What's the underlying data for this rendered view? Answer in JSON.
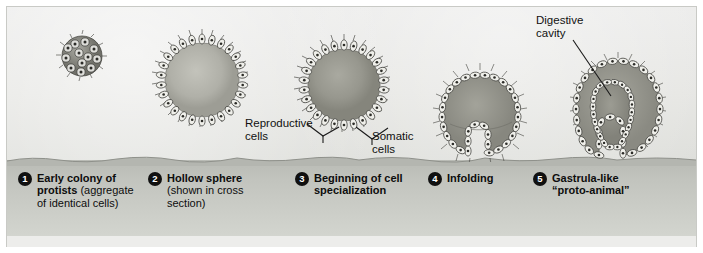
{
  "figure": {
    "colors": {
      "sky": "#e7e7e4",
      "ground": "#c2c4be",
      "ink": "#111111",
      "badge": "#101010",
      "badge_text": "#ffffff",
      "cell_fill": "#efefea",
      "cell_outline": "#4a4a46",
      "interior": "#9a9a93"
    }
  },
  "callouts": [
    {
      "id": "reproductive",
      "label": "Reproductive\ncells"
    },
    {
      "id": "somatic",
      "label": "Somatic\ncells"
    },
    {
      "id": "digestive",
      "label": "Digestive\ncavity"
    }
  ],
  "stages": [
    {
      "number": "1",
      "title": "Early colony of protists",
      "title_bold": "Early colony of\nprotists",
      "line1": "Early colony of",
      "rest_bold": "protists",
      "rest_regular": " (aggregate\nof identical cells)",
      "detail": "(aggregate of identical cells)"
    },
    {
      "number": "2",
      "title": "Hollow sphere",
      "line1": "Hollow sphere",
      "rest_bold": "",
      "rest_regular": "(shown in cross\nsection)",
      "detail": "(shown in cross section)"
    },
    {
      "number": "3",
      "title": "Beginning of cell specialization",
      "line1": "Beginning of cell",
      "rest_bold": "specialization",
      "rest_regular": "",
      "detail": ""
    },
    {
      "number": "4",
      "title": "Infolding",
      "line1": "Infolding",
      "rest_bold": "",
      "rest_regular": "",
      "detail": ""
    },
    {
      "number": "5",
      "title": "Gastrula-like \"proto-animal\"",
      "line1": "Gastrula-like",
      "rest_bold": "“proto-animal”",
      "rest_regular": "",
      "detail": ""
    }
  ]
}
